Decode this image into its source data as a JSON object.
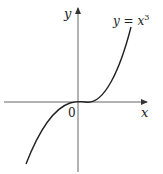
{
  "figure": {
    "x_axis_label": "x",
    "y_axis_label": "y",
    "origin_label": "0",
    "curve_label_lhs": "y = x",
    "curve_label_exp": "3",
    "function": "y = x^3",
    "colors": {
      "axis": "#555555",
      "curve": "#222222",
      "background": "#ffffff"
    }
  }
}
